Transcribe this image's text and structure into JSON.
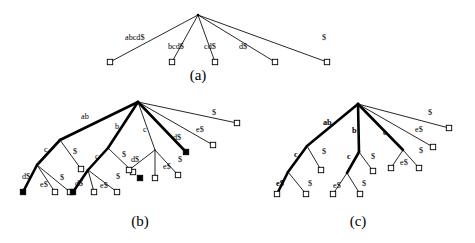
{
  "figure": {
    "background_color": "#ffffff",
    "ink_color": "#000000",
    "width": 475,
    "height": 243,
    "panels": [
      {
        "id": "a",
        "caption": "(a)",
        "caption_x": 198,
        "caption_y": 80,
        "root": {
          "x": 198,
          "y": 15
        },
        "description": "Flat suffix trie root with five leaf edges labelled by full suffixes",
        "edges": [
          {
            "label": "abcd$",
            "label_x": 125,
            "label_y": 38,
            "weight": "thin",
            "from": [
              198,
              15
            ],
            "to": [
              110,
              62
            ]
          },
          {
            "label": "bcd$",
            "label_x": 168,
            "label_y": 47,
            "weight": "thin",
            "from": [
              198,
              15
            ],
            "to": [
              172,
              62
            ]
          },
          {
            "label": "cd$",
            "label_x": 204,
            "label_y": 47,
            "weight": "thin",
            "from": [
              198,
              15
            ],
            "to": [
              215,
              62
            ]
          },
          {
            "label": "d$",
            "label_x": 239,
            "label_y": 47,
            "weight": "thin",
            "from": [
              198,
              15
            ],
            "to": [
              275,
              62
            ]
          },
          {
            "label": "$",
            "label_x": 322,
            "label_y": 38,
            "weight": "thin",
            "from": [
              198,
              15
            ],
            "to": [
              327,
              62
            ]
          }
        ],
        "leaves": [
          {
            "x": 110,
            "y": 62,
            "fill": "open"
          },
          {
            "x": 172,
            "y": 62,
            "fill": "open"
          },
          {
            "x": 215,
            "y": 62,
            "fill": "open"
          },
          {
            "x": 275,
            "y": 62,
            "fill": "open"
          },
          {
            "x": 327,
            "y": 62,
            "fill": "open"
          }
        ]
      },
      {
        "id": "b",
        "caption": "(b)",
        "caption_x": 140,
        "caption_y": 226,
        "root": {
          "x": 138,
          "y": 102
        },
        "description": "Compacted suffix tree with internal nodes ab, b, c and filled (marked) leaves",
        "edges": [
          {
            "label": "ab",
            "label_x": 81,
            "label_y": 117,
            "weight": "bold",
            "from": [
              138,
              102
            ],
            "to": [
              60,
              140
            ]
          },
          {
            "label": "b",
            "label_x": 115,
            "label_y": 127,
            "weight": "bold",
            "from": [
              138,
              102
            ],
            "to": [
              108,
              148
            ]
          },
          {
            "label": "c",
            "label_x": 143,
            "label_y": 130,
            "weight": "thin",
            "from": [
              138,
              102
            ],
            "to": [
              155,
              150
            ]
          },
          {
            "label": "d$",
            "label_x": 173,
            "label_y": 138,
            "weight": "bold",
            "from": [
              138,
              102
            ],
            "to": [
              186,
              152
            ]
          },
          {
            "label": "e$",
            "label_x": 196,
            "label_y": 130,
            "weight": "thin",
            "from": [
              138,
              102
            ],
            "to": [
              213,
              145
            ]
          },
          {
            "label": "$",
            "label_x": 212,
            "label_y": 113,
            "weight": "thin",
            "from": [
              138,
              102
            ],
            "to": [
              237,
              123
            ]
          },
          {
            "label": "c",
            "label_x": 44,
            "label_y": 150,
            "weight": "bold",
            "from": [
              60,
              140
            ],
            "to": [
              37,
              165
            ]
          },
          {
            "label": "$",
            "label_x": 73,
            "label_y": 152,
            "weight": "thin",
            "from": [
              60,
              140
            ],
            "to": [
              81,
              169
            ]
          },
          {
            "label": "d$",
            "label_x": 22,
            "label_y": 177,
            "weight": "bold",
            "from": [
              37,
              165
            ],
            "to": [
              23,
              192
            ]
          },
          {
            "label": "e$",
            "label_x": 40,
            "label_y": 185,
            "weight": "thin",
            "from": [
              37,
              165
            ],
            "to": [
              55,
              192
            ]
          },
          {
            "label": "$",
            "label_x": 60,
            "label_y": 178,
            "weight": "thin",
            "from": [
              37,
              165
            ],
            "to": [
              70,
              192
            ]
          },
          {
            "label": "c",
            "label_x": 95,
            "label_y": 157,
            "weight": "bold",
            "from": [
              108,
              148
            ],
            "to": [
              88,
              170
            ]
          },
          {
            "label": "$",
            "label_x": 122,
            "label_y": 155,
            "weight": "thin",
            "from": [
              108,
              148
            ],
            "to": [
              133,
              172
            ]
          },
          {
            "label": "d$",
            "label_x": 75,
            "label_y": 184,
            "weight": "bold",
            "from": [
              88,
              170
            ],
            "to": [
              73,
              192
            ]
          },
          {
            "label": "e$",
            "label_x": 100,
            "label_y": 186,
            "weight": "thin",
            "from": [
              88,
              170
            ],
            "to": [
              117,
              192
            ]
          },
          {
            "label": "$",
            "label_x": 116,
            "label_y": 177,
            "weight": "thin",
            "from": [
              88,
              170
            ],
            "to": [
              94,
              192
            ]
          },
          {
            "label": "d$",
            "label_x": 131,
            "label_y": 160,
            "weight": "thin",
            "from": [
              155,
              150
            ],
            "to": [
              129,
              170
            ]
          },
          {
            "label": "e$",
            "label_x": 163,
            "label_y": 167,
            "weight": "thin",
            "from": [
              155,
              150
            ],
            "to": [
              155,
              178
            ]
          },
          {
            "label": "$",
            "label_x": 178,
            "label_y": 160,
            "weight": "thin",
            "from": [
              155,
              150
            ],
            "to": [
              178,
              175
            ]
          }
        ],
        "leaves": [
          {
            "x": 81,
            "y": 169,
            "fill": "open"
          },
          {
            "x": 23,
            "y": 192,
            "fill": "filled"
          },
          {
            "x": 55,
            "y": 192,
            "fill": "open"
          },
          {
            "x": 70,
            "y": 192,
            "fill": "open"
          },
          {
            "x": 133,
            "y": 172,
            "fill": "open"
          },
          {
            "x": 73,
            "y": 192,
            "fill": "filled"
          },
          {
            "x": 94,
            "y": 192,
            "fill": "open"
          },
          {
            "x": 117,
            "y": 192,
            "fill": "open"
          },
          {
            "x": 129,
            "y": 170,
            "fill": "open"
          },
          {
            "x": 140,
            "y": 178,
            "fill": "filled"
          },
          {
            "x": 155,
            "y": 178,
            "fill": "open"
          },
          {
            "x": 178,
            "y": 175,
            "fill": "open"
          },
          {
            "x": 186,
            "y": 152,
            "fill": "filled"
          },
          {
            "x": 213,
            "y": 145,
            "fill": "open"
          },
          {
            "x": 237,
            "y": 123,
            "fill": "open"
          }
        ]
      },
      {
        "id": "c",
        "caption": "(c)",
        "caption_x": 358,
        "caption_y": 226,
        "root": {
          "x": 358,
          "y": 104
        },
        "description": "Final suffix tree with bold path labels ab, b, c and all open leaves",
        "edges": [
          {
            "label": "ab",
            "label_x": 323,
            "label_y": 123,
            "weight": "bold",
            "from": [
              358,
              104
            ],
            "to": [
              307,
              146
            ]
          },
          {
            "label": "b",
            "label_x": 352,
            "label_y": 131,
            "weight": "bold",
            "from": [
              358,
              104
            ],
            "to": [
              359,
              152
            ]
          },
          {
            "label": "c",
            "label_x": 383,
            "label_y": 133,
            "weight": "bold",
            "from": [
              358,
              104
            ],
            "to": [
              403,
              150
            ]
          },
          {
            "label": "e$",
            "label_x": 415,
            "label_y": 130,
            "weight": "thin",
            "from": [
              358,
              104
            ],
            "to": [
              433,
              147
            ]
          },
          {
            "label": "$",
            "label_x": 428,
            "label_y": 113,
            "weight": "thin",
            "from": [
              358,
              104
            ],
            "to": [
              449,
              128
            ]
          },
          {
            "label": "c",
            "label_x": 294,
            "label_y": 155,
            "weight": "bold",
            "from": [
              307,
              146
            ],
            "to": [
              288,
              172
            ]
          },
          {
            "label": "$",
            "label_x": 322,
            "label_y": 152,
            "weight": "thin",
            "from": [
              307,
              146
            ],
            "to": [
              321,
              170
            ]
          },
          {
            "label": "e$",
            "label_x": 276,
            "label_y": 184,
            "weight": "bold",
            "from": [
              288,
              172
            ],
            "to": [
              277,
              194
            ]
          },
          {
            "label": "$",
            "label_x": 308,
            "label_y": 184,
            "weight": "thin",
            "from": [
              288,
              172
            ],
            "to": [
              306,
              194
            ]
          },
          {
            "label": "c",
            "label_x": 347,
            "label_y": 157,
            "weight": "bold",
            "from": [
              359,
              152
            ],
            "to": [
              347,
              173
            ]
          },
          {
            "label": "$",
            "label_x": 371,
            "label_y": 157,
            "weight": "thin",
            "from": [
              359,
              152
            ],
            "to": [
              373,
              171
            ]
          },
          {
            "label": "e$",
            "label_x": 333,
            "label_y": 186,
            "weight": "thin",
            "from": [
              347,
              173
            ],
            "to": [
              333,
              194
            ]
          },
          {
            "label": "$",
            "label_x": 362,
            "label_y": 184,
            "weight": "thin",
            "from": [
              347,
              173
            ],
            "to": [
              360,
              194
            ]
          },
          {
            "label": "e$",
            "label_x": 400,
            "label_y": 163,
            "weight": "thin",
            "from": [
              403,
              150
            ],
            "to": [
              391,
              168
            ]
          },
          {
            "label": "$",
            "label_x": 419,
            "label_y": 151,
            "weight": "thin",
            "from": [
              403,
              150
            ],
            "to": [
              419,
              168
            ]
          }
        ],
        "leaves": [
          {
            "x": 277,
            "y": 194,
            "fill": "open"
          },
          {
            "x": 306,
            "y": 194,
            "fill": "open"
          },
          {
            "x": 321,
            "y": 170,
            "fill": "open"
          },
          {
            "x": 333,
            "y": 194,
            "fill": "open"
          },
          {
            "x": 360,
            "y": 194,
            "fill": "open"
          },
          {
            "x": 373,
            "y": 171,
            "fill": "open"
          },
          {
            "x": 391,
            "y": 168,
            "fill": "open"
          },
          {
            "x": 419,
            "y": 168,
            "fill": "open"
          },
          {
            "x": 433,
            "y": 147,
            "fill": "open"
          },
          {
            "x": 449,
            "y": 128,
            "fill": "open"
          }
        ]
      }
    ]
  }
}
